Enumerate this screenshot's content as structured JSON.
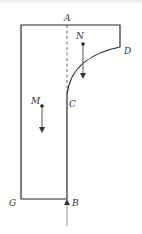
{
  "diagram": {
    "type": "physics-slide-track",
    "colors": {
      "outline": "#2a2a2a",
      "dashed": "#555555",
      "arrow": "#444444",
      "label": "#333333",
      "background": "#ffffff"
    },
    "labels": {
      "A": "A",
      "B": "B",
      "C": "C",
      "D": "D",
      "G": "G",
      "M": "M",
      "N": "N"
    },
    "points": {
      "top_left": [
        21,
        25
      ],
      "A": [
        67,
        25
      ],
      "top_right": [
        120,
        25
      ],
      "D": [
        120,
        47
      ],
      "C": [
        67,
        95
      ],
      "B": [
        67,
        199
      ],
      "G": [
        21,
        199
      ],
      "M": [
        42,
        106
      ],
      "N": [
        83,
        44
      ]
    },
    "arrows": {
      "N_force": {
        "from": [
          83,
          44
        ],
        "to": [
          83,
          78
        ],
        "direction": "down"
      },
      "M_force": {
        "from": [
          42,
          106
        ],
        "to": [
          42,
          132
        ],
        "direction": "down"
      },
      "B_force": {
        "from": [
          67,
          226
        ],
        "to": [
          67,
          199
        ],
        "direction": "up"
      }
    }
  }
}
